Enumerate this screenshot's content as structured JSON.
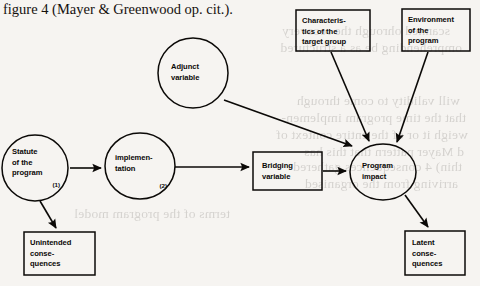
{
  "figure": {
    "caption": "figure 4 (Mayer & Greenwood op. cit.).",
    "type": "flow-diagram",
    "background_color": "#f6f4f1",
    "ink_color": "#0b0907"
  },
  "nodes": [
    {
      "id": "statute",
      "shape": "ellipse",
      "label_lines": [
        "Statute",
        "of the",
        "program"
      ],
      "number": "(1)",
      "cx": 35,
      "cy": 168,
      "rx": 33,
      "ry": 33
    },
    {
      "id": "implementation",
      "shape": "ellipse",
      "label_lines": [
        "implemen-",
        "tation"
      ],
      "number": "(2)",
      "cx": 140,
      "cy": 166,
      "rx": 35,
      "ry": 33
    },
    {
      "id": "adjunct-variable",
      "shape": "ellipse",
      "label_lines": [
        "Adjunct",
        "variable"
      ],
      "number": "",
      "cx": 193,
      "cy": 73,
      "rx": 35,
      "ry": 35
    },
    {
      "id": "characteristics-target-group",
      "shape": "rect",
      "label_lines": [
        "Characteris-",
        "tics of the",
        "target group"
      ],
      "number": "",
      "x": 296,
      "y": 10,
      "w": 74,
      "h": 41
    },
    {
      "id": "environment-program",
      "shape": "rect",
      "label_lines": [
        "Environment",
        "of the",
        "program"
      ],
      "number": "",
      "x": 402,
      "y": 9,
      "w": 68,
      "h": 42
    },
    {
      "id": "bridging-variable",
      "shape": "rect",
      "label_lines": [
        "Bridging",
        "variable"
      ],
      "number": "",
      "x": 253,
      "y": 152,
      "w": 69,
      "h": 38
    },
    {
      "id": "program-impact",
      "shape": "ellipse",
      "label_lines": [
        "Program",
        "impact"
      ],
      "number": "",
      "cx": 383,
      "cy": 172,
      "rx": 33,
      "ry": 28
    },
    {
      "id": "unintended-consequences",
      "shape": "rect",
      "label_lines": [
        "Unintended",
        "conse-",
        "quences"
      ],
      "number": "",
      "x": 24,
      "y": 232,
      "w": 71,
      "h": 43
    },
    {
      "id": "latent-consequences",
      "shape": "rect",
      "label_lines": [
        "Latent",
        "conse-",
        "quences"
      ],
      "number": "",
      "x": 405,
      "y": 231,
      "w": 60,
      "h": 44
    }
  ],
  "edges": [
    {
      "id": "statute-to-implementation",
      "from": "statute",
      "to": "implementation"
    },
    {
      "id": "statute-to-unintended",
      "from": "statute",
      "to": "unintended-consequences"
    },
    {
      "id": "implementation-to-bridging",
      "from": "implementation",
      "to": "bridging-variable"
    },
    {
      "id": "adjunct-to-impact",
      "from": "adjunct-variable",
      "to": "program-impact"
    },
    {
      "id": "characteristics-to-impact",
      "from": "characteristics-target-group",
      "to": "program-impact"
    },
    {
      "id": "environment-to-impact",
      "from": "environment-program",
      "to": "program-impact"
    },
    {
      "id": "bridging-to-impact",
      "from": "bridging-variable",
      "to": "program-impact"
    },
    {
      "id": "impact-to-latent",
      "from": "program-impact",
      "to": "latent-consequences"
    }
  ],
  "ghost_text": [
    {
      "text": "scanned ohrough the  recovery",
      "x": 30,
      "y": 22
    },
    {
      "text": "omprehending  be as a structured",
      "x": 18,
      "y": 39
    },
    {
      "text": "will  validity  to  come  through",
      "x": 20,
      "y": 92
    },
    {
      "text": "that  the time program implemen-",
      "x": 14,
      "y": 109
    },
    {
      "text": "weigh it or of  the entire context of",
      "x": 12,
      "y": 126
    },
    {
      "text": "d  Mayer  pattern  that  this  has",
      "x": 16,
      "y": 143
    },
    {
      "text": "thin)  4 consequences  gathered",
      "x": 18,
      "y": 158
    },
    {
      "text": "arriving  from  the  organised",
      "x": 22,
      "y": 175
    },
    {
      "text": "terms  of  the  program  model",
      "x": 250,
      "y": 205
    }
  ]
}
